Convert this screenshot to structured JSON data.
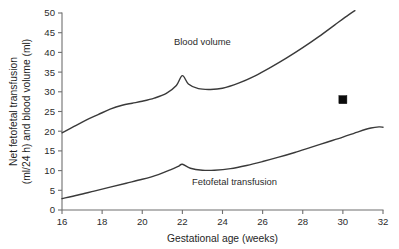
{
  "chart_data": {
    "type": "line",
    "title": "",
    "xlabel": "Gestational age (weeks)",
    "ylabel_line1": "Net fetofetal transfusion",
    "ylabel_line2": "(ml/24 h) and blood volume (ml)",
    "xlim": [
      16,
      32
    ],
    "ylim": [
      0,
      50
    ],
    "xticks": [
      16,
      18,
      20,
      22,
      24,
      26,
      28,
      30,
      32
    ],
    "xticklabels": [
      "16",
      "18",
      "20",
      "22",
      "24",
      "26",
      "28",
      "30",
      "32"
    ],
    "yticks": [
      0,
      5,
      10,
      15,
      20,
      25,
      30,
      35,
      40,
      45,
      50
    ],
    "yticklabels": [
      "0",
      "5",
      "10",
      "15",
      "20",
      "25",
      "30",
      "35",
      "40",
      "45",
      "50"
    ],
    "grid": false,
    "legend_position": "inline-annotations",
    "series": [
      {
        "name": "Blood volume",
        "label": "Blood volume",
        "label_x": 23.0,
        "label_y": 42.0,
        "color": "#3a3a3a",
        "x": [
          16.0,
          16.6,
          17.2,
          17.8,
          18.4,
          19.0,
          19.5,
          20.0,
          20.6,
          21.2,
          21.7,
          22.0,
          22.3,
          22.8,
          23.4,
          24.0,
          24.8,
          25.6,
          26.4,
          27.2,
          28.0,
          28.8,
          29.6,
          30.3,
          30.6
        ],
        "y": [
          19.6,
          21.2,
          22.8,
          24.2,
          25.6,
          26.6,
          27.1,
          27.6,
          28.4,
          29.6,
          31.6,
          34.1,
          32.0,
          30.8,
          30.6,
          30.9,
          32.2,
          34.0,
          36.2,
          38.6,
          41.2,
          44.0,
          47.0,
          49.6,
          50.6
        ]
      },
      {
        "name": "Fetofetal transfusion",
        "label": "Fetofetal transfusion",
        "label_x": 24.6,
        "label_y": 6.4,
        "color": "#3a3a3a",
        "x": [
          16.0,
          16.8,
          17.6,
          18.4,
          19.2,
          20.0,
          20.8,
          21.4,
          21.8,
          22.0,
          22.4,
          23.0,
          23.6,
          24.4,
          25.2,
          26.0,
          26.8,
          27.6,
          28.4,
          29.2,
          30.0,
          30.8,
          31.4,
          31.8,
          32.0
        ],
        "y": [
          2.9,
          3.8,
          4.8,
          5.8,
          6.8,
          7.8,
          9.0,
          10.2,
          11.1,
          11.6,
          10.6,
          10.1,
          10.1,
          10.5,
          11.3,
          12.3,
          13.4,
          14.6,
          15.9,
          17.2,
          18.5,
          19.9,
          20.8,
          21.1,
          21.0
        ]
      }
    ],
    "markers": [
      {
        "name": "data-point-marker",
        "shape": "square",
        "x": 30.0,
        "y": 28.0,
        "color": "#0b0b0b",
        "size": 8
      }
    ]
  }
}
